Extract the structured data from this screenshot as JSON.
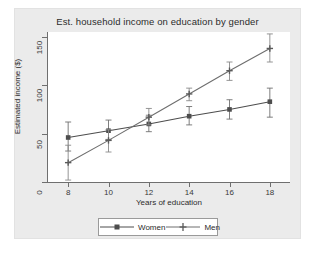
{
  "chart_data": {
    "type": "line",
    "title": "Est. household income on education by gender",
    "xlabel": "Years of education",
    "ylabel": "Estimated income ($)",
    "x": [
      8,
      10,
      12,
      14,
      16,
      18
    ],
    "xlim": [
      7,
      19
    ],
    "ylim": [
      0,
      155
    ],
    "xticks": [
      "8",
      "10",
      "12",
      "14",
      "16",
      "18"
    ],
    "yticks": [
      "0",
      "50",
      "100",
      "150"
    ],
    "grid": false,
    "legend_position": "bottom-center",
    "series": [
      {
        "name": "Women",
        "marker": "filled-square",
        "color": "#4d4d4d",
        "values": [
          46,
          53,
          60,
          68,
          75,
          83
        ],
        "err_low": [
          32,
          44,
          52,
          59,
          65,
          67
        ],
        "err_high": [
          62,
          64,
          69,
          78,
          85,
          97
        ]
      },
      {
        "name": "Men",
        "marker": "plus",
        "color": "#6e6e6e",
        "values": [
          20,
          43,
          67,
          91,
          115,
          138
        ],
        "err_low": [
          2,
          31,
          59,
          84,
          105,
          124
        ],
        "err_high": [
          38,
          54,
          76,
          97,
          124,
          153
        ]
      }
    ]
  },
  "legend": {
    "items": [
      {
        "label": "Women"
      },
      {
        "label": "Men"
      }
    ]
  }
}
